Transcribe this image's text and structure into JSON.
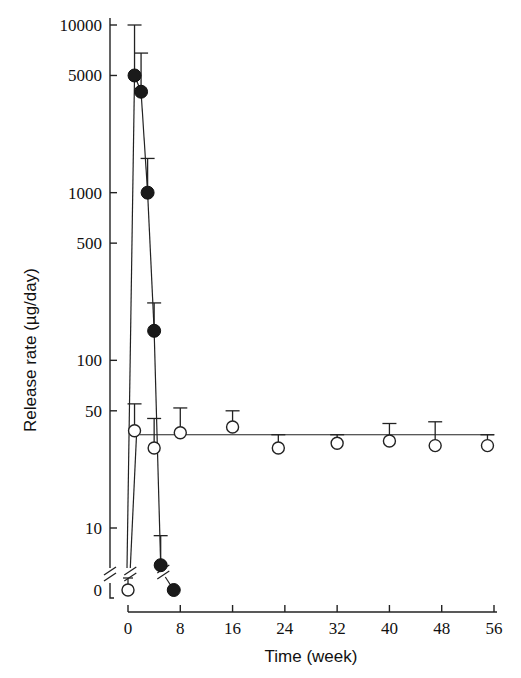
{
  "chart_data": {
    "type": "line",
    "title": "",
    "xlabel": "Time (week)",
    "ylabel": "Release rate (µg/day)",
    "yscale": "log (with broken axis; 0 shown below break)",
    "xlim": [
      0,
      56
    ],
    "ylim": [
      0,
      10000
    ],
    "grid": false,
    "legend": null,
    "x_ticks": [
      0,
      8,
      16,
      24,
      32,
      40,
      48,
      56
    ],
    "x_tick_labels": [
      "0",
      "8",
      "16",
      "24",
      "32",
      "40",
      "48",
      "56"
    ],
    "y_ticks": [
      0,
      10,
      50,
      100,
      500,
      1000,
      5000,
      10000
    ],
    "y_tick_labels": [
      "0",
      "10",
      "50",
      "100",
      "500",
      "1000",
      "5000",
      "10000"
    ],
    "series": [
      {
        "name": "filled circles (burst release)",
        "marker": "filled-circle",
        "x": [
          0,
          1,
          2,
          3,
          4,
          5,
          7
        ],
        "values": [
          0,
          5000,
          4000,
          1000,
          150,
          6,
          0
        ],
        "error_upper": [
          null,
          10000,
          6800,
          1600,
          220,
          9,
          null
        ]
      },
      {
        "name": "open circles (sustained release)",
        "marker": "open-circle",
        "x": [
          0,
          1,
          4,
          8,
          16,
          23,
          32,
          40,
          47,
          55
        ],
        "values": [
          0,
          38,
          30,
          37,
          40,
          30,
          32,
          33,
          31,
          31
        ],
        "error_upper": [
          2,
          55,
          45,
          52,
          50,
          36,
          36,
          42,
          43,
          36
        ],
        "fit_line_value": 36
      }
    ]
  }
}
